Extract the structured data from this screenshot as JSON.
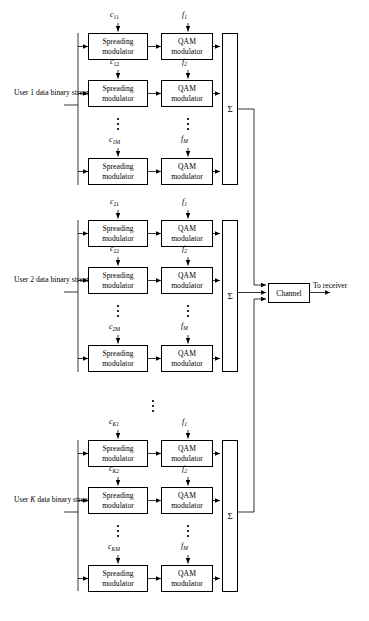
{
  "figure": {
    "type": "block-diagram",
    "background_color": "#ffffff",
    "line_color": "#000000"
  },
  "blocks": {
    "spreading": {
      "line1": "Spreading",
      "line2": "modulator"
    },
    "qam": {
      "line1": "QAM",
      "line2": "modulator"
    },
    "sum_symbol": "Σ",
    "channel_label": "Channel"
  },
  "users": [
    {
      "id": "user-1",
      "input_label_lines": [
        "User 1 data",
        "binary",
        "stream"
      ],
      "branches": [
        {
          "spread_code": "c",
          "spread_sub": "11",
          "carrier": "f",
          "carrier_sub": "1"
        },
        {
          "spread_code": "c",
          "spread_sub": "12",
          "carrier": "f",
          "carrier_sub": "2"
        },
        {
          "spread_code": "c",
          "spread_sub": "1M",
          "carrier": "f",
          "carrier_sub": "M"
        }
      ]
    },
    {
      "id": "user-2",
      "input_label_lines": [
        "User 2 data",
        "binary",
        "stream"
      ],
      "branches": [
        {
          "spread_code": "c",
          "spread_sub": "21",
          "carrier": "f",
          "carrier_sub": "1"
        },
        {
          "spread_code": "c",
          "spread_sub": "22",
          "carrier": "f",
          "carrier_sub": "2"
        },
        {
          "spread_code": "c",
          "spread_sub": "2M",
          "carrier": "f",
          "carrier_sub": "M"
        }
      ]
    },
    {
      "id": "user-k",
      "input_label_lines": [
        "User K data",
        "binary",
        "stream"
      ],
      "branches": [
        {
          "spread_code": "c",
          "spread_sub": "K1",
          "carrier": "f",
          "carrier_sub": "1"
        },
        {
          "spread_code": "c",
          "spread_sub": "K2",
          "carrier": "f",
          "carrier_sub": "2"
        },
        {
          "spread_code": "c",
          "spread_sub": "KM",
          "carrier": "f",
          "carrier_sub": "M"
        }
      ]
    }
  ],
  "output": {
    "to_receiver_label": "To receiver"
  },
  "ellipsis_count": 3
}
